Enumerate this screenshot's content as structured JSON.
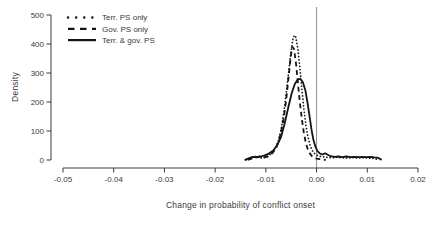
{
  "figure": {
    "background": "#ffffff",
    "axis_color": "#3a3a3a",
    "text_color": "#3a3a3a",
    "curve_color": "#141414",
    "refline_color": "#8f8f8f"
  },
  "chart_data": {
    "type": "line",
    "subtype": "density-curves",
    "title": "",
    "xlabel": "Change in probability of conflict onset",
    "ylabel": "Density",
    "xlim": [
      -0.05,
      0.02
    ],
    "ylim": [
      0,
      500
    ],
    "grid": "off",
    "legend_position": "top-left",
    "reference_line_x": 0,
    "x_tick_values": [
      -0.05,
      -0.04,
      -0.03,
      -0.02,
      -0.01,
      0,
      0.01,
      0.02
    ],
    "x_tick_labels": [
      "-0.05",
      "-0.04",
      "-0.03",
      "-0.02",
      "-0.01",
      "0.00",
      "0.01",
      "0.02"
    ],
    "y_tick_values": [
      0,
      100,
      200,
      300,
      400,
      500
    ],
    "y_tick_labels": [
      "0",
      "100",
      "200",
      "300",
      "400",
      "500"
    ],
    "series": [
      {
        "name": "Terr. PS only",
        "style": "dotted",
        "peak": {
          "x": -0.0044,
          "density": 430
        },
        "points": [
          [
            -0.014,
            0
          ],
          [
            -0.0133,
            4
          ],
          [
            -0.0126,
            9
          ],
          [
            -0.012,
            13
          ],
          [
            -0.0113,
            9
          ],
          [
            -0.0106,
            6
          ],
          [
            -0.01,
            10
          ],
          [
            -0.0094,
            16
          ],
          [
            -0.0088,
            24
          ],
          [
            -0.0082,
            38
          ],
          [
            -0.0076,
            62
          ],
          [
            -0.007,
            105
          ],
          [
            -0.0064,
            170
          ],
          [
            -0.0058,
            260
          ],
          [
            -0.0052,
            350
          ],
          [
            -0.0047,
            415
          ],
          [
            -0.0044,
            430
          ],
          [
            -0.0041,
            424
          ],
          [
            -0.0037,
            385
          ],
          [
            -0.0033,
            320
          ],
          [
            -0.0029,
            245
          ],
          [
            -0.0025,
            175
          ],
          [
            -0.0021,
            120
          ],
          [
            -0.0017,
            80
          ],
          [
            -0.0013,
            52
          ],
          [
            -0.0009,
            34
          ],
          [
            -0.0005,
            24
          ],
          [
            0.0,
            17
          ],
          [
            0.0006,
            13
          ],
          [
            0.0012,
            11
          ],
          [
            0.002,
            9
          ],
          [
            0.003,
            8
          ],
          [
            0.004,
            9
          ],
          [
            0.005,
            8
          ],
          [
            0.006,
            7
          ],
          [
            0.007,
            8
          ],
          [
            0.008,
            7
          ],
          [
            0.009,
            8
          ],
          [
            0.01,
            7
          ],
          [
            0.0108,
            6
          ],
          [
            0.0116,
            4
          ],
          [
            0.0122,
            0
          ]
        ]
      },
      {
        "name": "Gov. PS only",
        "style": "dashed",
        "peak": {
          "x": -0.0048,
          "density": 390
        },
        "points": [
          [
            -0.0136,
            0
          ],
          [
            -0.0128,
            5
          ],
          [
            -0.012,
            9
          ],
          [
            -0.0112,
            12
          ],
          [
            -0.0104,
            9
          ],
          [
            -0.0096,
            12
          ],
          [
            -0.0088,
            22
          ],
          [
            -0.008,
            40
          ],
          [
            -0.0073,
            75
          ],
          [
            -0.0066,
            130
          ],
          [
            -0.006,
            205
          ],
          [
            -0.0055,
            290
          ],
          [
            -0.0051,
            355
          ],
          [
            -0.0048,
            390
          ],
          [
            -0.0045,
            384
          ],
          [
            -0.0041,
            340
          ],
          [
            -0.0037,
            270
          ],
          [
            -0.0033,
            200
          ],
          [
            -0.0029,
            140
          ],
          [
            -0.0025,
            92
          ],
          [
            -0.0021,
            58
          ],
          [
            -0.0017,
            36
          ],
          [
            -0.0013,
            22
          ],
          [
            -0.0009,
            13
          ],
          [
            -0.0005,
            8
          ],
          [
            0.0,
            5
          ],
          [
            0.0006,
            3
          ],
          [
            0.0012,
            2
          ],
          [
            0.0018,
            0
          ]
        ]
      },
      {
        "name": "Terr. & gov. PS",
        "style": "solid",
        "peak": {
          "x": -0.0032,
          "density": 280
        },
        "points": [
          [
            -0.0142,
            0
          ],
          [
            -0.0134,
            6
          ],
          [
            -0.0126,
            11
          ],
          [
            -0.0118,
            9
          ],
          [
            -0.011,
            12
          ],
          [
            -0.0102,
            16
          ],
          [
            -0.0094,
            22
          ],
          [
            -0.0086,
            32
          ],
          [
            -0.0078,
            50
          ],
          [
            -0.007,
            80
          ],
          [
            -0.0063,
            125
          ],
          [
            -0.0056,
            180
          ],
          [
            -0.0049,
            230
          ],
          [
            -0.0043,
            262
          ],
          [
            -0.0037,
            278
          ],
          [
            -0.0032,
            280
          ],
          [
            -0.0027,
            268
          ],
          [
            -0.0022,
            240
          ],
          [
            -0.0018,
            200
          ],
          [
            -0.0014,
            152
          ],
          [
            -0.001,
            105
          ],
          [
            -0.0006,
            68
          ],
          [
            -0.0002,
            44
          ],
          [
            0.0002,
            30
          ],
          [
            0.0007,
            22
          ],
          [
            0.0012,
            19
          ],
          [
            0.0017,
            23
          ],
          [
            0.0022,
            18
          ],
          [
            0.0028,
            13
          ],
          [
            0.0035,
            11
          ],
          [
            0.0043,
            12
          ],
          [
            0.0051,
            10
          ],
          [
            0.0059,
            12
          ],
          [
            0.0067,
            10
          ],
          [
            0.0075,
            11
          ],
          [
            0.0083,
            10
          ],
          [
            0.0091,
            11
          ],
          [
            0.0099,
            10
          ],
          [
            0.0107,
            11
          ],
          [
            0.0114,
            9
          ],
          [
            0.012,
            8
          ],
          [
            0.0125,
            4
          ],
          [
            0.0128,
            0
          ]
        ]
      }
    ]
  }
}
